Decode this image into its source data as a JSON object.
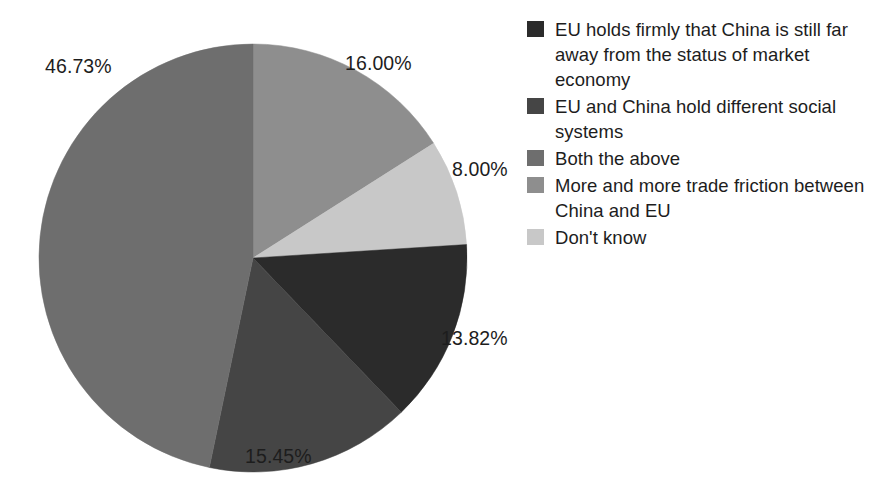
{
  "chart_data": {
    "type": "pie",
    "title": "",
    "subtitle": "",
    "xlabel": "",
    "ylabel": "",
    "legend_position": "right",
    "grid": false,
    "start_angle_deg": 0,
    "direction": "clockwise",
    "categories": [
      "More and more trade friction between China and EU",
      "Don't know",
      "EU holds firmly that China is still far away from the status of market economy",
      "EU and China hold different social systems",
      "Both the above"
    ],
    "values": [
      16.0,
      8.0,
      13.82,
      15.45,
      46.73
    ],
    "value_labels": [
      "16.00%",
      "8.00%",
      "13.82%",
      "15.45%",
      "46.73%"
    ],
    "colors": [
      "#8e8e8e",
      "#c8c8c8",
      "#2b2b2b",
      "#454545",
      "#6e6e6e"
    ],
    "slices": [
      {
        "label": "More and more trade friction between China and EU",
        "value": 16.0,
        "value_label": "16.00%",
        "color": "#8e8e8e"
      },
      {
        "label": "Don't know",
        "value": 8.0,
        "value_label": "8.00%",
        "color": "#c8c8c8"
      },
      {
        "label": "EU holds firmly that China is still far away from the status of market economy",
        "value": 13.82,
        "value_label": "13.82%",
        "color": "#2b2b2b"
      },
      {
        "label": "EU and China hold different social systems",
        "value": 15.45,
        "value_label": "15.45%",
        "color": "#454545"
      },
      {
        "label": "Both the above",
        "value": 46.73,
        "value_label": "46.73%",
        "color": "#6e6e6e"
      }
    ]
  },
  "legend": {
    "items": [
      {
        "label": "EU holds firmly that China is still far away from the status of market economy",
        "color": "#2b2b2b"
      },
      {
        "label": "EU and China hold different social systems",
        "color": "#454545"
      },
      {
        "label": "Both the above",
        "color": "#6e6e6e"
      },
      {
        "label": "More and more trade friction between China and EU",
        "color": "#8e8e8e"
      },
      {
        "label": "Don't know",
        "color": "#c8c8c8"
      }
    ]
  },
  "labels": {
    "pct_0": "16.00%",
    "pct_1": "8.00%",
    "pct_2": "13.82%",
    "pct_3": "15.45%",
    "pct_4": "46.73%"
  }
}
